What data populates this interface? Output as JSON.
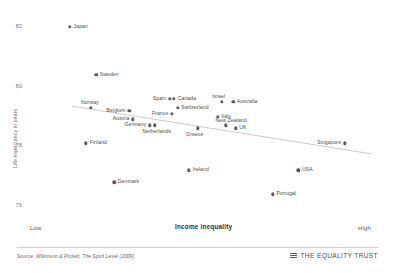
{
  "chart_data": {
    "type": "scatter",
    "title": "",
    "xlabel": "Income inequality",
    "ylabel": "Life expectancy in years",
    "x_axis_low_label": "Low",
    "x_axis_high_label": "High",
    "yticks": [
      "82",
      "80",
      "78",
      "76"
    ],
    "ylim": [
      75.6,
      82.3
    ],
    "xlim": [
      0,
      100
    ],
    "grid": false,
    "legend": "none",
    "trendline": {
      "visible": true,
      "note": "downward-sloping best-fit line",
      "x_start": 12,
      "y_start": 79.35,
      "x_end": 98,
      "y_end": 77.75
    },
    "points": [
      {
        "label": "Japan",
        "x": 11.5,
        "y": 82.0,
        "label_side": "right"
      },
      {
        "label": "Sweden",
        "x": 19.0,
        "y": 80.4,
        "label_side": "right"
      },
      {
        "label": "Norway",
        "x": 17.5,
        "y": 79.3,
        "label_side": "above"
      },
      {
        "label": "Belgium",
        "x": 28.5,
        "y": 79.2,
        "label_side": "left"
      },
      {
        "label": "Austria",
        "x": 29.6,
        "y": 78.9,
        "label_side": "left"
      },
      {
        "label": "Germany",
        "x": 34.4,
        "y": 78.7,
        "label_side": "left"
      },
      {
        "label": "Netherlands",
        "x": 35.8,
        "y": 78.7,
        "label_side": "below"
      },
      {
        "label": "Finland",
        "x": 16.1,
        "y": 78.1,
        "label_side": "right"
      },
      {
        "label": "Spain",
        "x": 40.2,
        "y": 79.6,
        "label_side": "left"
      },
      {
        "label": "Canada",
        "x": 41.4,
        "y": 79.6,
        "label_side": "right"
      },
      {
        "label": "France",
        "x": 40.8,
        "y": 79.1,
        "label_side": "left"
      },
      {
        "label": "Switzerland",
        "x": 42.4,
        "y": 79.3,
        "label_side": "right"
      },
      {
        "label": "Greece",
        "x": 48.3,
        "y": 78.6,
        "label_side": "below"
      },
      {
        "label": "Israel",
        "x": 55.2,
        "y": 79.5,
        "label_side": "above"
      },
      {
        "label": "Australia",
        "x": 58.4,
        "y": 79.5,
        "label_side": "right"
      },
      {
        "label": "Italy",
        "x": 53.9,
        "y": 79.0,
        "label_side": "right"
      },
      {
        "label": "New Zealand",
        "x": 56.2,
        "y": 78.7,
        "label_side": "above"
      },
      {
        "label": "UK",
        "x": 59.1,
        "y": 78.6,
        "label_side": "right"
      },
      {
        "label": "Singapore",
        "x": 90.5,
        "y": 78.1,
        "label_side": "left"
      },
      {
        "label": "Ireland",
        "x": 45.7,
        "y": 77.2,
        "label_side": "right"
      },
      {
        "label": "USA",
        "x": 77.1,
        "y": 77.2,
        "label_side": "right"
      },
      {
        "label": "Denmark",
        "x": 24.2,
        "y": 76.8,
        "label_side": "right"
      },
      {
        "label": "Portugal",
        "x": 69.8,
        "y": 76.4,
        "label_side": "right"
      }
    ]
  },
  "footer": {
    "source": "Source: Wilkinson & Pickett, The Spirit Level (2009)",
    "brand": "THE EQUALITY TRUST",
    "brand_mark_icon": "bars-icon"
  }
}
